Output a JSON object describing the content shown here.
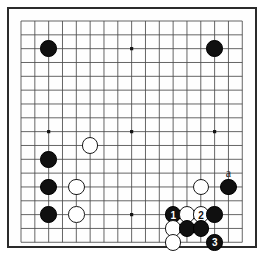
{
  "diagram": {
    "kind": "go-board-diagram",
    "board_size": 17,
    "visible_columns": 17,
    "visible_rows": 16,
    "geometry": {
      "origin_x": 21,
      "origin_y": 21,
      "cell": 13.83,
      "frame_left": 7,
      "frame_top": 7,
      "frame_width": 250,
      "frame_height": 241,
      "stone_diameter": 16.5,
      "line_color": "#4a4a4a",
      "frame_color": "#2b2b2b",
      "black_color": "#101010",
      "white_color": "#ffffff",
      "background": "#ffffff"
    },
    "star_points": [
      {
        "col": 3,
        "row": 3
      },
      {
        "col": 9,
        "row": 3
      },
      {
        "col": 15,
        "row": 3
      },
      {
        "col": 3,
        "row": 9
      },
      {
        "col": 9,
        "row": 9
      },
      {
        "col": 15,
        "row": 9
      },
      {
        "col": 9,
        "row": 15
      }
    ],
    "stones": [
      {
        "id": "b-upper-left-star",
        "color": "black",
        "col": 3,
        "row": 3,
        "label": ""
      },
      {
        "id": "b-upper-right-star",
        "color": "black",
        "col": 15,
        "row": 3,
        "label": ""
      },
      {
        "id": "w-left-upper-approach",
        "color": "white",
        "col": 6,
        "row": 10,
        "label": ""
      },
      {
        "id": "b-left-upper",
        "color": "black",
        "col": 3,
        "row": 11,
        "label": ""
      },
      {
        "id": "b-left-middle",
        "color": "black",
        "col": 3,
        "row": 13,
        "label": ""
      },
      {
        "id": "w-left-middle",
        "color": "white",
        "col": 5,
        "row": 13,
        "label": ""
      },
      {
        "id": "b-left-lower",
        "color": "black",
        "col": 3,
        "row": 15,
        "label": ""
      },
      {
        "id": "w-left-lower",
        "color": "white",
        "col": 5,
        "row": 15,
        "label": ""
      },
      {
        "id": "w-right-upper",
        "color": "white",
        "col": 14,
        "row": 13,
        "label": ""
      },
      {
        "id": "b-right-edge",
        "color": "black",
        "col": 16,
        "row": 13,
        "label": ""
      },
      {
        "id": "b-move-1",
        "color": "black",
        "col": 12,
        "row": 15,
        "label": "1"
      },
      {
        "id": "w-right-contact",
        "color": "white",
        "col": 13,
        "row": 15,
        "label": ""
      },
      {
        "id": "w-move-2",
        "color": "white",
        "col": 14,
        "row": 15,
        "label": "2"
      },
      {
        "id": "b-right-cut",
        "color": "black",
        "col": 15,
        "row": 15,
        "label": ""
      },
      {
        "id": "w-below-one",
        "color": "white",
        "col": 12,
        "row": 16,
        "label": ""
      },
      {
        "id": "b-below-left",
        "color": "black",
        "col": 13,
        "row": 16,
        "label": ""
      },
      {
        "id": "b-below-right",
        "color": "black",
        "col": 14,
        "row": 16,
        "label": ""
      },
      {
        "id": "w-bottom",
        "color": "white",
        "col": 12,
        "row": 17,
        "label": ""
      },
      {
        "id": "b-move-3",
        "color": "black",
        "col": 15,
        "row": 17,
        "label": "3"
      }
    ],
    "coordinate_labels": [
      {
        "id": "point-a",
        "text": "a",
        "col": 16,
        "row": 12
      }
    ]
  }
}
